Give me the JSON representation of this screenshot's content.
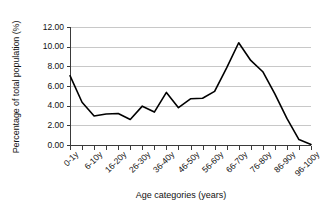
{
  "chart_data": {
    "type": "line",
    "title": "",
    "xlabel": "Age categories (years)",
    "ylabel": "Percentage of total population (%)",
    "ylim": [
      0.0,
      12.0
    ],
    "ytick_values": [
      0.0,
      2.0,
      4.0,
      6.0,
      8.0,
      10.0,
      12.0
    ],
    "ytick_labels": [
      "0.00",
      "2.00",
      "4.00",
      "6.00",
      "8.00",
      "10.00",
      "12.00"
    ],
    "grid": true,
    "legend": false,
    "legend_position": "none",
    "line_color": "#000000",
    "x_ticklabels": [
      "0-1y",
      "6-10y",
      "16-20y",
      "26-30y",
      "36-40y",
      "46-50y",
      "56-60y",
      "66-70y",
      "76-80y",
      "86-90y",
      "96-100y"
    ],
    "categories": [
      "0-1y",
      "2-5y",
      "6-10y",
      "11-15y",
      "16-20y",
      "21-25y",
      "26-30y",
      "31-35y",
      "36-40y",
      "41-45y",
      "46-50y",
      "51-55y",
      "56-60y",
      "61-65y",
      "66-70y",
      "71-75y",
      "76-80y",
      "81-85y",
      "86-90y",
      "91-95y",
      "96-100y"
    ],
    "values": [
      7.05,
      4.35,
      2.95,
      3.15,
      3.2,
      2.6,
      3.95,
      3.35,
      5.35,
      3.8,
      4.7,
      4.75,
      5.45,
      7.85,
      10.4,
      8.6,
      7.45,
      5.2,
      2.7,
      0.55,
      0.05
    ]
  }
}
